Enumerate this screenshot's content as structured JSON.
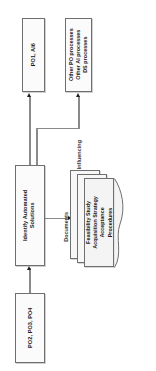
{
  "diagram": {
    "orientation": "rotated-90-ccw",
    "colors": {
      "box_fill": "#fbfbfb",
      "box_border": "#6f6f6f",
      "connector": "#8a8a8a",
      "arrow": "#1d1d1d",
      "text": "#1b1b1b",
      "label_text": "#3a3a3a",
      "background": "#ffffff"
    },
    "nodes": {
      "po1_ai6": {
        "label": "PO1, AI6",
        "shape": "process-box"
      },
      "other_processes": {
        "line1": "Other PO processes",
        "line2": "Other AI processes",
        "line3": "DS processes",
        "shape": "process-box"
      },
      "identify_automated_solutions": {
        "line1": "Identify Automated",
        "line2": "Solutions",
        "shape": "process-box"
      },
      "po2_po3_po4": {
        "label": "PO2, PO3, PO4",
        "shape": "process-box"
      },
      "documents_stack": {
        "line1": "Feasibility Study",
        "line2": "Acquisition Strategy",
        "line3": "Acceptance",
        "line4": "Procedures",
        "shape": "multi-document",
        "sheet_count": 3
      }
    },
    "edge_labels": {
      "influencing": "Influencing",
      "documents": "Documents"
    }
  }
}
